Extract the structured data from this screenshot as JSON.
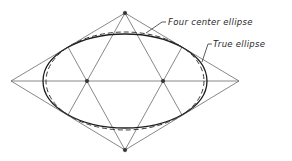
{
  "diagram": {
    "labels": {
      "four_center": "Four center ellipse",
      "true_ellipse": "True ellipse"
    },
    "rhombus": {
      "top": [
        125,
        13
      ],
      "right": [
        239,
        81
      ],
      "bottom": [
        125,
        150
      ],
      "left": [
        11,
        81
      ]
    },
    "centers": [
      [
        87,
        81
      ],
      [
        163,
        81
      ]
    ],
    "true_ellipse": {
      "cx": 125,
      "cy": 81,
      "rx": 82,
      "ry": 47
    },
    "four_center_ellipse": {
      "cx": 125,
      "cy": 81,
      "rx": 80,
      "ry": 49
    },
    "colors": {
      "background": "#ffffff",
      "construction_lines": "#6a6a6a",
      "ellipse": "#1e1e1e",
      "text": "#2a2a2a"
    }
  }
}
